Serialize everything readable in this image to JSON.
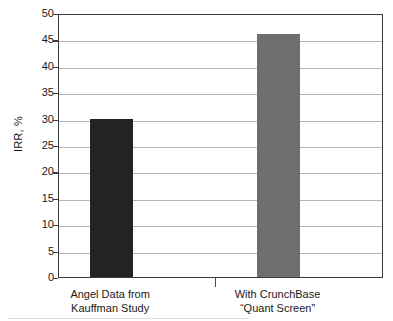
{
  "chart_data": {
    "type": "bar",
    "title": "",
    "xlabel": "",
    "ylabel": "IRR, %",
    "ylim": [
      0,
      50
    ],
    "ytick_step": 5,
    "grid": true,
    "legend": "none",
    "categories": [
      "Angel Data from\nKauffman Study",
      "With CrunchBase\n“Quant Screen”"
    ],
    "category_lines": [
      [
        "Angel Data from",
        "Kauffman Study"
      ],
      [
        "With CrunchBase",
        "“Quant Screen”"
      ]
    ],
    "values": [
      30,
      46
    ],
    "bar_colors": [
      "#232323",
      "#6e6e6e"
    ],
    "yticks": [
      0,
      5,
      10,
      15,
      20,
      25,
      30,
      35,
      40,
      45,
      50
    ],
    "ytick_labels": [
      "0",
      "5",
      "10",
      "15",
      "20",
      "25",
      "30",
      "35",
      "40",
      "45",
      "50"
    ],
    "axis_color": "#3a3a3a",
    "grid_color": "#b4b4b4",
    "background": "#ffffff"
  }
}
